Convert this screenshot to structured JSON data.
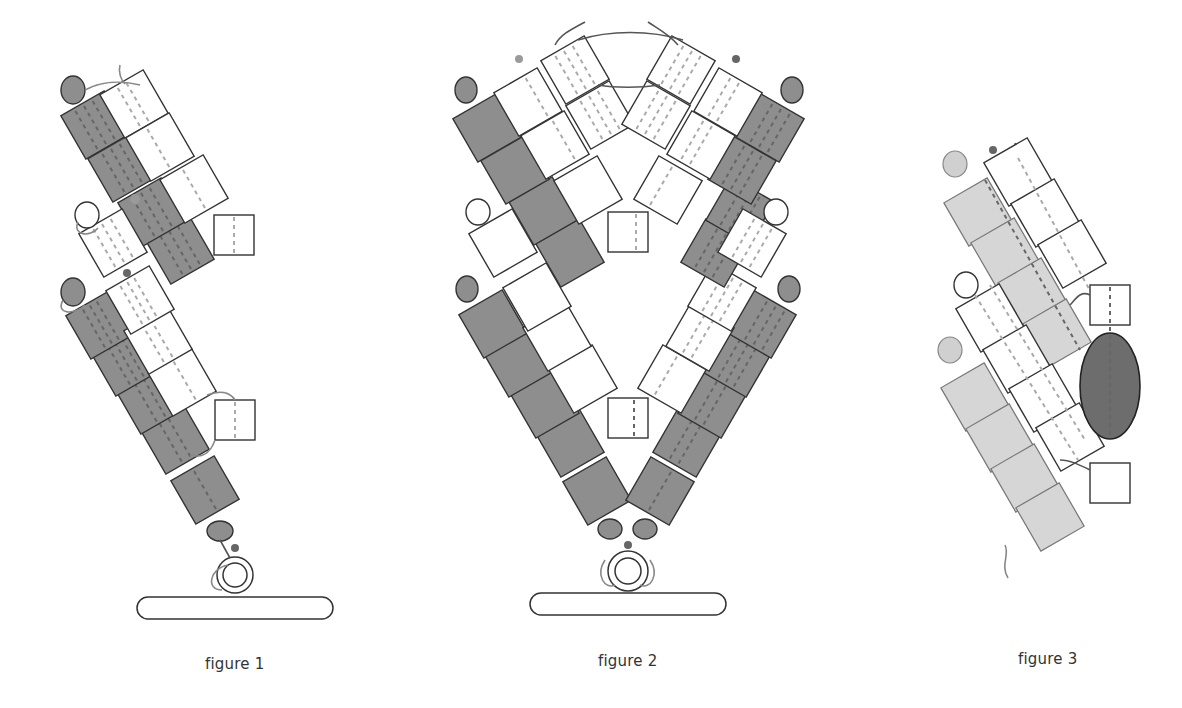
{
  "figures": [
    {
      "id": "figure-1",
      "caption": "figure 1",
      "description": "Single bent chain of square domains anchored on a membrane bar by a ring base",
      "colors": {
        "dark": "#8e8e8e",
        "white": "#ffffff",
        "outline": "#333333"
      }
    },
    {
      "id": "figure-2",
      "caption": "figure 2",
      "description": "Two mirrored chains forming a V / arch shape joined at top, anchored on a membrane bar",
      "colors": {
        "dark": "#8e8e8e",
        "white": "#ffffff",
        "outline": "#333333"
      }
    },
    {
      "id": "figure-3",
      "caption": "figure 3",
      "description": "Tilted double chain of light-grey and white domains with a large dark ellipse on the right side",
      "colors": {
        "light": "#d6d6d6",
        "white": "#ffffff",
        "ellipse": "#6d6d6d"
      }
    }
  ]
}
